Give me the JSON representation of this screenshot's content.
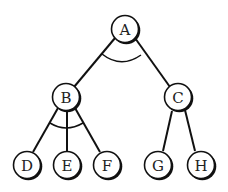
{
  "diagram": {
    "type": "tree",
    "nodes": [
      {
        "id": "A",
        "label": "A",
        "x": 125,
        "y": 29
      },
      {
        "id": "B",
        "label": "B",
        "x": 66,
        "y": 97
      },
      {
        "id": "C",
        "label": "C",
        "x": 178,
        "y": 97
      },
      {
        "id": "D",
        "label": "D",
        "x": 27,
        "y": 165
      },
      {
        "id": "E",
        "label": "E",
        "x": 67,
        "y": 165
      },
      {
        "id": "F",
        "label": "F",
        "x": 107,
        "y": 165
      },
      {
        "id": "G",
        "label": "G",
        "x": 158,
        "y": 165
      },
      {
        "id": "H",
        "label": "H",
        "x": 201,
        "y": 165
      }
    ],
    "edges": [
      [
        "A",
        "B"
      ],
      [
        "A",
        "C"
      ],
      [
        "B",
        "D"
      ],
      [
        "B",
        "E"
      ],
      [
        "B",
        "F"
      ],
      [
        "C",
        "G"
      ],
      [
        "C",
        "H"
      ]
    ],
    "and_arcs": [
      {
        "parent": "A",
        "children": [
          "B",
          "C"
        ]
      },
      {
        "parent": "B",
        "children": [
          "D",
          "E",
          "F"
        ]
      }
    ]
  }
}
